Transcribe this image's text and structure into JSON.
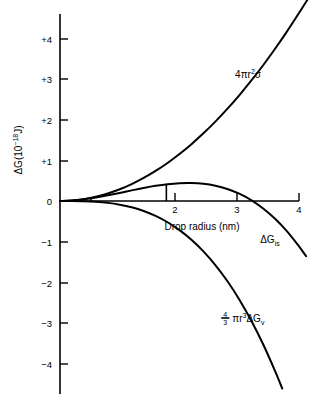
{
  "chart_data": {
    "type": "line",
    "title": "",
    "xlabel": "Drop radius (nm)",
    "ylabel": "ΔG(10⁻¹⁸J)",
    "ylabel_parts": {
      "delta_g": "ΔG(10",
      "exponent": "−18",
      "unit": "J)"
    },
    "xlim": [
      0,
      4.35
    ],
    "ylim": [
      -4.6,
      4.7
    ],
    "xticks": [
      2,
      3,
      4
    ],
    "xtick_labels": [
      "2",
      "3",
      "4"
    ],
    "yticks": [
      4,
      3,
      2,
      1,
      0,
      -1,
      -2,
      -3,
      -4
    ],
    "ytick_labels": [
      "+4",
      "+3",
      "+2",
      "+1",
      "0",
      "−1",
      "−2",
      "−3",
      "−4"
    ],
    "grid": false,
    "legend_position": "inline-curve-labels",
    "series": [
      {
        "name": "surface-energy-term",
        "label": "4πr²σ",
        "label_parts": {
          "coef": "4πr",
          "sup": "2",
          "tail": "σ"
        },
        "label_x": 2.93,
        "label_y": 3.05,
        "x": [
          0,
          0.2,
          0.4,
          0.6,
          0.8,
          1.0,
          1.2,
          1.4,
          1.6,
          1.8,
          2.0,
          2.2,
          2.4,
          2.6,
          2.8,
          3.0,
          3.2,
          3.4,
          3.6,
          3.8,
          4.0,
          4.15
        ],
        "y": [
          0,
          0.0116,
          0.0464,
          0.1044,
          0.1856,
          0.29,
          0.4176,
          0.5684,
          0.7424,
          0.9396,
          1.16,
          1.4036,
          1.6704,
          1.9604,
          2.2736,
          2.61,
          2.9696,
          3.3524,
          3.7584,
          4.1876,
          4.64,
          4.99
        ]
      },
      {
        "name": "volume-free-energy-term",
        "label": "4/3 πr³ΔGᵥ",
        "label_parts": {
          "num": "4",
          "den": "3",
          "mid": "πr",
          "sup": "3",
          "tail": "ΔG",
          "sub": "v"
        },
        "label_x": 2.7,
        "label_y": -2.95,
        "x": [
          0,
          0.2,
          0.4,
          0.6,
          0.8,
          1.0,
          1.2,
          1.4,
          1.6,
          1.8,
          2.0,
          2.2,
          2.4,
          2.6,
          2.8,
          3.0,
          3.2,
          3.4,
          3.6,
          3.72
        ],
        "y": [
          0,
          -0.00072,
          -0.00576,
          -0.01944,
          -0.04608,
          -0.09,
          -0.15552,
          -0.24696,
          -0.36864,
          -0.52488,
          -0.72,
          -0.95832,
          -1.24416,
          -1.58184,
          -1.97568,
          -2.43,
          -2.94912,
          -3.53736,
          -4.19904,
          -4.63
        ]
      },
      {
        "name": "total-free-energy",
        "label": "ΔGᵢₛ",
        "label_parts": {
          "main": "ΔG",
          "sub": "is"
        },
        "label_x": 3.35,
        "label_y": -1.03,
        "x": [
          0,
          0.2,
          0.4,
          0.6,
          0.8,
          1.0,
          1.2,
          1.4,
          1.6,
          1.8,
          2.0,
          2.2,
          2.4,
          2.6,
          2.8,
          3.0,
          3.2,
          3.4,
          3.6,
          3.8,
          4.0,
          4.12
        ],
        "y": [
          0,
          0.0109,
          0.0406,
          0.085,
          0.1395,
          0.2,
          0.2621,
          0.3214,
          0.3738,
          0.4147,
          0.44,
          0.4453,
          0.4262,
          0.3786,
          0.2979,
          0.18,
          0.0205,
          -0.185,
          -0.4406,
          -0.7512,
          -1.12,
          -1.365
        ]
      }
    ],
    "annotations": [
      {
        "name": "critical-radius-marker",
        "type": "vertical-drop-line",
        "x": 1.78,
        "y_top": 0.415,
        "y_bottom": 0.0
      },
      {
        "name": "origin-tick-marker",
        "type": "small-tick",
        "x": 0.52,
        "y_top": 0.09,
        "y_bottom": 0.0
      }
    ]
  },
  "axes": {
    "x_axis_name": "drop-radius-axis",
    "y_axis_name": "free-energy-axis"
  }
}
